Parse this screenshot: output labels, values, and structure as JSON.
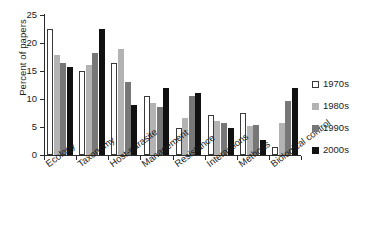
{
  "chart_data": {
    "type": "bar",
    "title": "",
    "subtitle": "",
    "xlabel": "",
    "ylabel": "Percent of papers",
    "ylim": [
      0,
      25
    ],
    "yticks": [
      0,
      5,
      10,
      15,
      20,
      25
    ],
    "ytick_labels": [
      "0",
      "5",
      "10",
      "15",
      "20",
      "25"
    ],
    "grid": false,
    "legend_position": "right",
    "categories": [
      "Ecology",
      "Taxonomy",
      "Host-parasite",
      "Management",
      "Resistance",
      "Interactions",
      "Methods",
      "Biological control"
    ],
    "series": [
      {
        "name": "1970s",
        "color": "#ffffff",
        "edge_color": "#3a3a3a",
        "values": [
          22.5,
          15.0,
          16.4,
          10.6,
          4.8,
          7.2,
          7.5,
          1.4
        ]
      },
      {
        "name": "1980s",
        "color": "#b3b3b3",
        "edge_color": "#b3b3b3",
        "values": [
          17.8,
          16.1,
          19.0,
          9.3,
          6.6,
          6.1,
          5.1,
          5.8
        ]
      },
      {
        "name": "1990s",
        "color": "#777777",
        "edge_color": "#777777",
        "values": [
          16.5,
          18.2,
          13.1,
          8.6,
          10.5,
          5.7,
          5.3,
          9.7
        ]
      },
      {
        "name": "2000s",
        "color": "#111111",
        "edge_color": "#111111",
        "values": [
          15.7,
          22.5,
          9.0,
          11.9,
          11.1,
          4.8,
          2.7,
          12.0
        ]
      }
    ]
  },
  "legend": {
    "items": [
      {
        "label": "1970s",
        "swatch": "white-square-swatch"
      },
      {
        "label": "1980s",
        "swatch": "light-gray-square-swatch"
      },
      {
        "label": "1990s",
        "swatch": "dark-gray-square-swatch"
      },
      {
        "label": "2000s",
        "swatch": "black-square-swatch"
      }
    ]
  },
  "axes": {
    "y_title": "Percent of papers"
  }
}
